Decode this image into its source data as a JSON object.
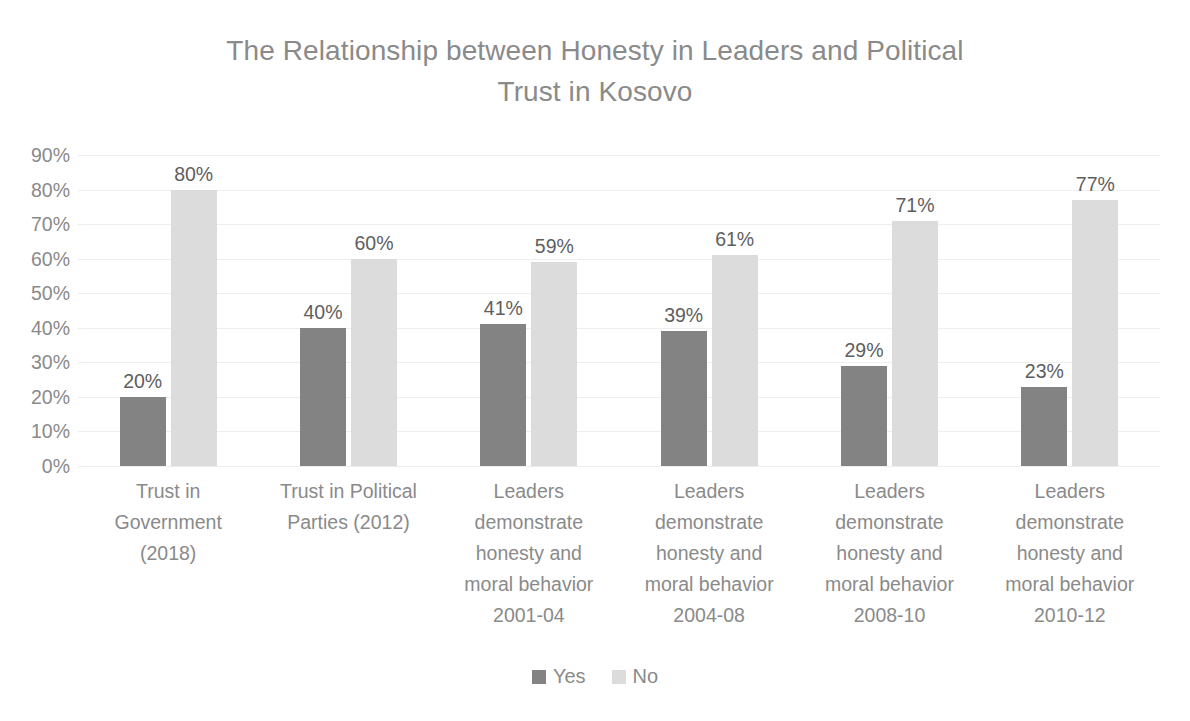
{
  "chart_data": {
    "type": "bar",
    "title": "The Relationship between Honesty in Leaders and Political Trust in Kosovo",
    "xlabel": "",
    "ylabel": "",
    "ylim": [
      0,
      90
    ],
    "ytick_step": 10,
    "grid": true,
    "grid_axis": "y",
    "legend_position": "bottom",
    "value_suffix": "%",
    "categories": [
      "Trust in Government (2018)",
      "Trust in Political Parties (2012)",
      "Leaders demonstrate honesty and moral behavior 2001-04",
      "Leaders demonstrate honesty and moral behavior 2004-08",
      "Leaders demonstrate honesty and moral behavior 2008-10",
      "Leaders demonstrate honesty and moral behavior 2010-12"
    ],
    "category_lines": [
      "Trust in\nGovernment\n(2018)",
      "Trust in Political\nParties (2012)",
      "Leaders\ndemonstrate\nhonesty and\nmoral behavior\n2001-04",
      "Leaders\ndemonstrate\nhonesty and\nmoral behavior\n2004-08",
      "Leaders\ndemonstrate\nhonesty and\nmoral behavior\n2008-10",
      "Leaders\ndemonstrate\nhonesty and\nmoral behavior\n2010-12"
    ],
    "ytick_labels": [
      "90%",
      "80%",
      "70%",
      "60%",
      "50%",
      "40%",
      "30%",
      "20%",
      "10%",
      "0%"
    ],
    "ytick_values": [
      90,
      80,
      70,
      60,
      50,
      40,
      30,
      20,
      10,
      0
    ],
    "series": [
      {
        "name": "Yes",
        "color": "#838383",
        "values": [
          20,
          40,
          41,
          39,
          29,
          23
        ],
        "labels": [
          "20%",
          "40%",
          "41%",
          "39%",
          "29%",
          "23%"
        ]
      },
      {
        "name": "No",
        "color": "#dcdcdc",
        "values": [
          80,
          60,
          59,
          61,
          71,
          77
        ],
        "labels": [
          "80%",
          "60%",
          "59%",
          "61%",
          "71%",
          "77%"
        ]
      }
    ]
  },
  "title_lines": "The Relationship between Honesty in Leaders and Political\nTrust in Kosovo",
  "legend": [
    {
      "label": "Yes",
      "color": "#838383"
    },
    {
      "label": "No",
      "color": "#dcdcdc"
    }
  ],
  "colors": {
    "title": "#8a8a8a",
    "axis_text": "#8a8a8a",
    "data_label": "#5e5e5e",
    "gridline": "#eeeeee",
    "background": "#ffffff"
  }
}
